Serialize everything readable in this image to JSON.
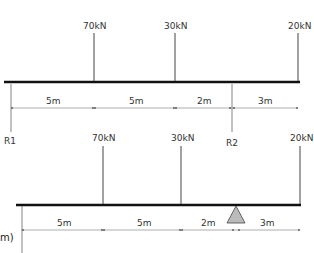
{
  "diagram_1": {
    "loads": [
      {
        "label": "70kN",
        "x": 94
      },
      {
        "label": "30kN",
        "x": 175
      },
      {
        "label": "20kN",
        "x": 298
      }
    ],
    "reactions": [
      {
        "label": "R1",
        "x": 11
      },
      {
        "label": "R2",
        "x": 232
      }
    ],
    "dimensions": [
      {
        "label": "5m",
        "x1": 11,
        "x2": 94
      },
      {
        "label": "5m",
        "x1": 94,
        "x2": 175
      },
      {
        "label": "2m",
        "x1": 175,
        "x2": 232
      },
      {
        "label": "3m",
        "x1": 232,
        "x2": 298
      }
    ]
  },
  "diagram_2": {
    "loads": [
      {
        "label": "70kN",
        "x": 103
      },
      {
        "label": "30kN",
        "x": 181
      },
      {
        "label": "20kN",
        "x": 300
      }
    ],
    "support": {
      "type": "triangle",
      "x": 236
    },
    "dimensions": [
      {
        "label": "5m",
        "x1": 22,
        "x2": 103
      },
      {
        "label": "5m",
        "x1": 103,
        "x2": 181
      },
      {
        "label": "2m",
        "x1": 181,
        "x2": 236
      },
      {
        "label": "3m",
        "x1": 236,
        "x2": 300
      }
    ],
    "side_label": "m)"
  },
  "colors": {
    "beam": "#111111",
    "line": "#555555",
    "support_fill": "#bbbbbb",
    "text": "#333333"
  }
}
